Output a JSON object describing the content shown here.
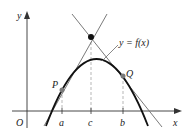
{
  "figure": {
    "curve_label": "y = f(x)",
    "axis_labels": {
      "x": "x",
      "y": "y",
      "origin": "O"
    },
    "points": [
      {
        "name": "P",
        "label": "P"
      },
      {
        "name": "Q",
        "label": "Q"
      }
    ],
    "tick_labels": [
      {
        "name": "a",
        "label": "a"
      },
      {
        "name": "c",
        "label": "c"
      },
      {
        "name": "b",
        "label": "b"
      }
    ],
    "colors": {
      "curve": "#111111",
      "tangent": "#6b6b6b",
      "axis": "#333333",
      "point": "#7a7a7a",
      "dashed": "#999999"
    }
  }
}
